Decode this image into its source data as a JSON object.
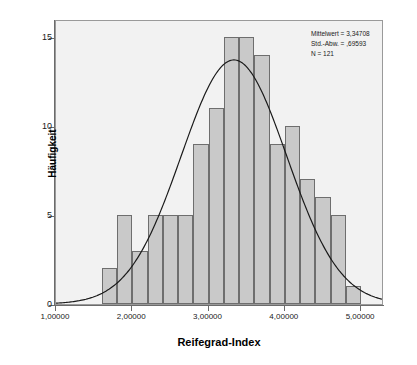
{
  "chart_data": {
    "type": "bar",
    "title": "",
    "subtitle": "",
    "xlabel": "Reifegrad-Index",
    "ylabel": "Häufigkeit",
    "xlim": [
      1.0,
      5.3
    ],
    "ylim": [
      0,
      16
    ],
    "grid": false,
    "bin_width": 0.2,
    "bin_starts": [
      1.6,
      1.8,
      2.0,
      2.2,
      2.4,
      2.6,
      2.8,
      3.0,
      3.2,
      3.4,
      3.6,
      3.8,
      4.0,
      4.2,
      4.4,
      4.6,
      4.8
    ],
    "categories": [
      "1.6-1.8",
      "1.8-2.0",
      "2.0-2.2",
      "2.2-2.4",
      "2.4-2.6",
      "2.6-2.8",
      "2.8-3.0",
      "3.0-3.2",
      "3.2-3.4",
      "3.4-3.6",
      "3.6-3.8",
      "3.8-4.0",
      "4.0-4.2",
      "4.2-4.4",
      "4.4-4.6",
      "4.6-4.8",
      "4.8-5.0"
    ],
    "values": [
      2,
      5,
      3,
      5,
      5,
      5,
      9,
      11,
      15,
      15,
      14,
      9,
      10,
      7,
      6,
      5,
      1
    ],
    "bar_gap_note": "bin 4.6-4.8 empty; final small bar at 4.8-5.0 has height 1",
    "xticks": [
      "1,00000",
      "2,00000",
      "3,00000",
      "4,00000",
      "5,00000"
    ],
    "xtick_values": [
      1.0,
      2.0,
      3.0,
      4.0,
      5.0
    ],
    "yticks": [
      "0",
      "5",
      "10",
      "15"
    ],
    "ytick_values": [
      0,
      5,
      10,
      15
    ],
    "overlay": {
      "type": "normal-curve",
      "mean": 3.34708,
      "std": 0.69593,
      "n": 121,
      "peak_height": 13.8
    },
    "colors": {
      "bar_fill": "#c9c9c9",
      "bar_border": "#6e6e6e",
      "plot_background": "#f2f2f2",
      "axis": "#6b6b6b",
      "curve": "#1a1a1a",
      "text": "#1a1a1a"
    }
  },
  "stats": {
    "mean_label": "Mittelwert = 3,34708",
    "std_label": "Std.-Abw. = ,69593",
    "n_label": "N = 121"
  }
}
